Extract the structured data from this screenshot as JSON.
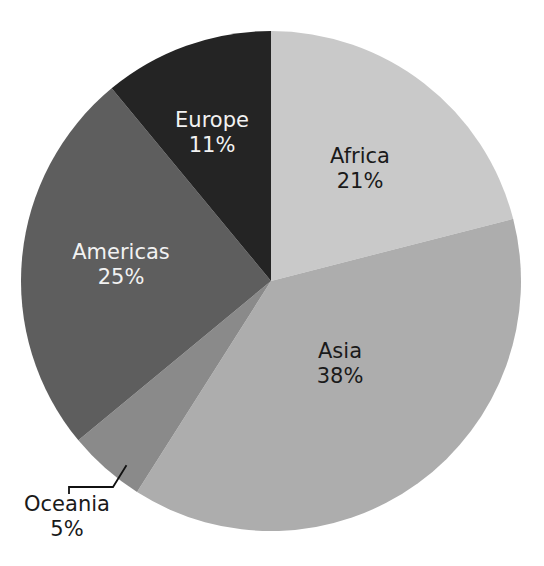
{
  "chart_data": {
    "type": "pie",
    "title": "",
    "subtitle": "",
    "xlabel": "",
    "ylabel": "",
    "legend": "none",
    "grid": false,
    "background_color": "#ffffff",
    "categories": [
      "Africa",
      "Asia",
      "Oceania",
      "Americas",
      "Europe"
    ],
    "values": [
      21,
      38,
      5,
      25,
      11
    ],
    "unit": "%",
    "start_angle_deg": 0,
    "direction": "clockwise",
    "slices": [
      {
        "label": "Africa",
        "value": 21,
        "value_text": "21%",
        "color": "#c9c9c9",
        "label_color": "#1a1a1a",
        "label_placement": "inside"
      },
      {
        "label": "Asia",
        "value": 38,
        "value_text": "38%",
        "color": "#adadad",
        "label_color": "#1a1a1a",
        "label_placement": "inside"
      },
      {
        "label": "Oceania",
        "value": 5,
        "value_text": "5%",
        "color": "#8a8a8a",
        "label_color": "#1a1a1a",
        "label_placement": "outside"
      },
      {
        "label": "Americas",
        "value": 25,
        "value_text": "25%",
        "color": "#5e5e5e",
        "label_color": "#f2f2f2",
        "label_placement": "inside"
      },
      {
        "label": "Europe",
        "value": 11,
        "value_text": "11%",
        "color": "#242424",
        "label_color": "#f2f2f2",
        "label_placement": "inside"
      }
    ],
    "geometry": {
      "center_x": 271,
      "center_y": 281,
      "radius": 250
    }
  },
  "labels": {
    "africa": {
      "name": "Africa",
      "percent": "21%",
      "x": 360,
      "y": 157,
      "pct_y": 182
    },
    "asia": {
      "name": "Asia",
      "percent": "38%",
      "x": 340,
      "y": 352,
      "pct_y": 377
    },
    "oceania": {
      "name": "Oceania",
      "percent": "5%",
      "x": 67,
      "y": 505,
      "pct_y": 530
    },
    "americas": {
      "name": "Americas",
      "percent": "25%",
      "x": 121,
      "y": 253,
      "pct_y": 278
    },
    "europe": {
      "name": "Europe",
      "percent": "11%",
      "x": 212,
      "y": 121,
      "pct_y": 146
    }
  },
  "leader": {
    "name": "oceania-leader-line",
    "path": "M 126 466 L 113 487 L 69 487 L 69 493"
  }
}
